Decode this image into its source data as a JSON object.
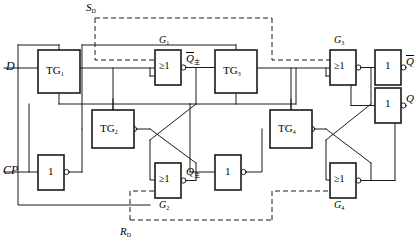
{
  "figure": {
    "type": "logic-circuit-schematic",
    "width": 418,
    "height": 247,
    "line_color": "#1a1a1a",
    "background": "#ffffff"
  },
  "inputs": [
    {
      "name": "data-input",
      "label": "D",
      "x": 10,
      "y": 62
    },
    {
      "name": "clock-input",
      "label": "CP",
      "x": 6,
      "y": 166
    },
    {
      "name": "set-direct-input",
      "label": "S",
      "subscript": "D",
      "x": 86,
      "y": 4
    },
    {
      "name": "reset-direct-input",
      "label": "R",
      "subscript": "D",
      "x": 120,
      "y": 228
    }
  ],
  "outputs": [
    {
      "name": "q-not-output",
      "label": "Q",
      "overbar": true,
      "x": 400,
      "y": 56
    },
    {
      "name": "q-output",
      "label": "Q",
      "overbar": false,
      "x": 400,
      "y": 94
    }
  ],
  "internal_nodes": [
    {
      "name": "master-q-not",
      "label": "Q",
      "overbar": true,
      "subscript": "主",
      "x": 181,
      "y": 53
    },
    {
      "name": "master-q",
      "label": "Q",
      "overbar": false,
      "subscript": "主",
      "x": 181,
      "y": 167
    }
  ],
  "transmission_gates": [
    {
      "name": "tg1",
      "label": "TG",
      "subscript": "1",
      "x": 38,
      "y": 55,
      "w": 42,
      "h": 38
    },
    {
      "name": "tg2",
      "label": "TG",
      "subscript": "2",
      "x": 92,
      "y": 110,
      "w": 42,
      "h": 38
    },
    {
      "name": "tg3",
      "label": "TG",
      "subscript": "3",
      "x": 215,
      "y": 55,
      "w": 42,
      "h": 38
    },
    {
      "name": "tg4",
      "label": "TG",
      "subscript": "4",
      "x": 270,
      "y": 110,
      "w": 42,
      "h": 38
    }
  ],
  "or_gates": [
    {
      "name": "g1",
      "label": "≥1",
      "tag": "G",
      "tag_sub": "1",
      "tag_pos": "top",
      "x": 155,
      "y": 50,
      "w": 26,
      "h": 35
    },
    {
      "name": "g2",
      "label": "≥1",
      "tag": "G",
      "tag_sub": "2",
      "tag_pos": "bottom",
      "x": 155,
      "y": 163,
      "w": 26,
      "h": 35
    },
    {
      "name": "g3",
      "label": "≥1",
      "tag": "G",
      "tag_sub": "3",
      "tag_pos": "top",
      "x": 330,
      "y": 50,
      "w": 26,
      "h": 35
    },
    {
      "name": "g4",
      "label": "≥1",
      "tag": "G",
      "tag_sub": "4",
      "tag_pos": "bottom",
      "x": 330,
      "y": 163,
      "w": 26,
      "h": 35
    }
  ],
  "inverters": [
    {
      "name": "clock-inverter",
      "label": "1",
      "x": 38,
      "y": 155,
      "w": 26,
      "h": 35
    },
    {
      "name": "mid-inverter",
      "label": "1",
      "x": 215,
      "y": 155,
      "w": 26,
      "h": 35
    },
    {
      "name": "out-inverter-top",
      "label": "1",
      "x": 375,
      "y": 50,
      "w": 26,
      "h": 35
    },
    {
      "name": "out-inverter-bottom",
      "label": "1",
      "x": 375,
      "y": 88,
      "w": 26,
      "h": 35
    }
  ],
  "dashed_rails": [
    {
      "name": "set-rail",
      "description": "S_D dashed control line entering G1 and G3"
    },
    {
      "name": "reset-rail",
      "description": "R_D dashed control line entering G2 and G4"
    }
  ]
}
